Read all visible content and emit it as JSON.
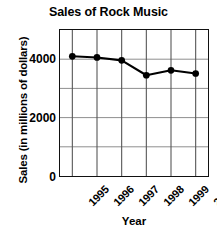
{
  "chart_data": {
    "type": "line",
    "title": "Sales of Rock Music",
    "xlabel": "Year",
    "ylabel": "Sales (in millions of dollars)",
    "categories": [
      "1995",
      "1996",
      "1997",
      "1998",
      "1999",
      "2000"
    ],
    "values": [
      4100,
      4060,
      3960,
      3450,
      3620,
      3510
    ],
    "series": [
      {
        "name": "Rock Music Sales",
        "values": [
          4100,
          4060,
          3960,
          3450,
          3620,
          3510
        ]
      }
    ],
    "ylim": [
      0,
      5000
    ],
    "ytick_labels": [
      "0",
      "2000",
      "4000"
    ],
    "ytick_values": [
      0,
      2000,
      4000
    ],
    "gridline_values": [
      1000,
      2000,
      3000,
      4000
    ],
    "grid": true,
    "legend": "none",
    "marker": "filled-circle",
    "line_color": "#000000",
    "marker_color": "#000000",
    "grid_color": "#808080",
    "axis_color": "#111111",
    "background_color": "#ffffff"
  }
}
